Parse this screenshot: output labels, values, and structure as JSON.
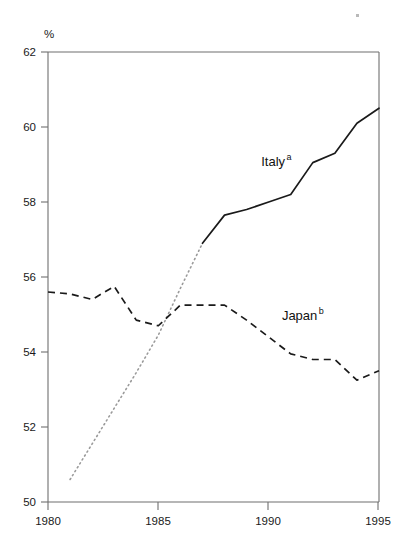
{
  "chart_data": {
    "type": "line",
    "title": "",
    "subtitle": "",
    "xlabel": "",
    "ylabel": "",
    "y_unit_label": "%",
    "xlim": [
      1980,
      1995
    ],
    "ylim": [
      50,
      62
    ],
    "xticks": [
      1980,
      1985,
      1990,
      1995
    ],
    "xtick_labels": [
      "1980",
      "1985",
      "1990",
      "1995"
    ],
    "yticks": [
      50,
      52,
      54,
      56,
      58,
      60,
      62
    ],
    "ytick_labels": [
      "50",
      "52",
      "54",
      "56",
      "58",
      "60",
      "62"
    ],
    "grid": false,
    "legend": "inline-annotations",
    "x": [
      1980,
      1981,
      1982,
      1983,
      1984,
      1985,
      1986,
      1987,
      1988,
      1989,
      1990,
      1991,
      1992,
      1993,
      1994,
      1995
    ],
    "series": [
      {
        "name": "Italy",
        "footnote_marker": "a",
        "style": "solid-with-dotted-prefix",
        "color": "#1a1a1a",
        "dotted_segment_years": [
          1981,
          1987
        ],
        "solid_segment_years": [
          1987,
          1995
        ],
        "x": [
          1981,
          1982,
          1983,
          1984,
          1985,
          1986,
          1987,
          1988,
          1989,
          1990,
          1991,
          1992,
          1993,
          1994,
          1995
        ],
        "values": [
          50.6,
          51.55,
          52.5,
          53.45,
          54.45,
          55.7,
          56.9,
          57.65,
          57.8,
          58.0,
          58.2,
          59.05,
          59.3,
          60.1,
          60.5
        ],
        "label_text": "Italy",
        "label_x": 1990.2,
        "label_y": 58.95
      },
      {
        "name": "Japan",
        "footnote_marker": "b",
        "style": "dashed",
        "color": "#1a1a1a",
        "x": [
          1980,
          1981,
          1982,
          1983,
          1984,
          1985,
          1986,
          1987,
          1988,
          1989,
          1990,
          1991,
          1992,
          1993,
          1994,
          1995
        ],
        "values": [
          55.6,
          55.55,
          55.4,
          55.75,
          54.85,
          54.7,
          55.25,
          55.25,
          55.25,
          54.85,
          54.4,
          53.95,
          53.8,
          53.8,
          53.25,
          53.5
        ],
        "label_text": "Japan",
        "label_x": 1991.4,
        "label_y": 54.85
      }
    ]
  },
  "axes": {
    "y_unit": "%",
    "x_labels": [
      "1980",
      "1985",
      "1990",
      "1995"
    ],
    "y_labels": [
      "62",
      "60",
      "58",
      "56",
      "54",
      "52",
      "50"
    ]
  },
  "annotations": {
    "italy": {
      "text": "Italy",
      "marker": "a"
    },
    "japan": {
      "text": "Japan",
      "marker": "b"
    }
  }
}
